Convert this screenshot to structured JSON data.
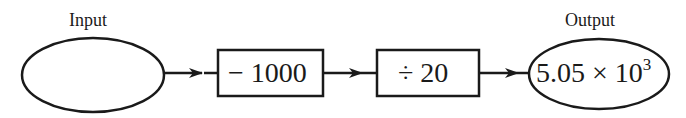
{
  "diagram": {
    "type": "function-machine",
    "input": {
      "label": "Input",
      "value": ""
    },
    "steps": [
      {
        "operation": "− 1000"
      },
      {
        "operation": "÷ 20"
      }
    ],
    "output": {
      "label": "Output",
      "mantissa": "5.05 × 10",
      "exponent": "3"
    },
    "colors": {
      "stroke": "#1a1a1a",
      "background": "#ffffff"
    }
  }
}
